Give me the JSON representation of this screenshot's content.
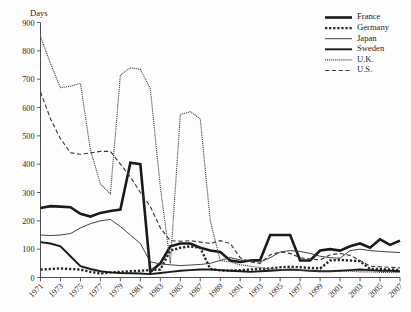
{
  "chart_data": {
    "type": "line",
    "title": "",
    "xlabel": "",
    "ylabel": "Days",
    "ylim": [
      0,
      900
    ],
    "ytick_labels": [
      "0",
      "100",
      "200",
      "300",
      "400",
      "500",
      "600",
      "700",
      "800",
      "900"
    ],
    "ytick_values": [
      0,
      100,
      200,
      300,
      400,
      500,
      600,
      700,
      800,
      900
    ],
    "grid": false,
    "legend_position": "top-right",
    "x": [
      1971,
      1972,
      1973,
      1974,
      1975,
      1976,
      1977,
      1978,
      1979,
      1980,
      1981,
      1982,
      1983,
      1984,
      1985,
      1986,
      1987,
      1988,
      1989,
      1990,
      1991,
      1992,
      1993,
      1994,
      1995,
      1996,
      1997,
      1998,
      1999,
      2000,
      2001,
      2002,
      2003,
      2004,
      2005,
      2006,
      2007
    ],
    "xtick_labels": [
      "1971",
      "1973",
      "1975",
      "1977",
      "1979",
      "1981",
      "1983",
      "1985",
      "1987",
      "1989",
      "1991",
      "1993",
      "1995",
      "1997",
      "1999",
      "2001",
      "2003",
      "2005",
      "2007"
    ],
    "xtick_values": [
      1971,
      1973,
      1975,
      1977,
      1979,
      1981,
      1983,
      1985,
      1987,
      1989,
      1991,
      1993,
      1995,
      1997,
      1999,
      2001,
      2003,
      2005,
      2007
    ],
    "series": [
      {
        "name": "France",
        "style": "solid",
        "width": 2.6,
        "color": "#1a1a1a",
        "values": [
          245,
          252,
          250,
          248,
          225,
          215,
          228,
          235,
          240,
          405,
          400,
          20,
          50,
          110,
          120,
          120,
          105,
          95,
          90,
          60,
          55,
          60,
          62,
          150,
          150,
          150,
          60,
          60,
          95,
          100,
          95,
          110,
          120,
          105,
          135,
          115,
          130
        ]
      },
      {
        "name": "Germany",
        "style": "dotted",
        "width": 2.4,
        "color": "#2a2a2a",
        "values": [
          28,
          30,
          32,
          30,
          28,
          20,
          14,
          18,
          20,
          22,
          24,
          26,
          28,
          95,
          105,
          110,
          105,
          30,
          25,
          24,
          26,
          28,
          30,
          32,
          36,
          38,
          36,
          34,
          32,
          60,
          62,
          60,
          58,
          30,
          30,
          28,
          26
        ]
      },
      {
        "name": "Japan",
        "style": "solid",
        "width": 0.95,
        "color": "#3a3a3a",
        "values": [
          150,
          148,
          150,
          155,
          175,
          190,
          200,
          205,
          180,
          150,
          120,
          55,
          48,
          45,
          42,
          44,
          46,
          50,
          60,
          70,
          62,
          58,
          55,
          70,
          90,
          95,
          92,
          85,
          75,
          70,
          68,
          95,
          100,
          95,
          92,
          90,
          88
        ]
      },
      {
        "name": "Sweden",
        "style": "solid",
        "width": 1.9,
        "color": "#1a1a1a",
        "values": [
          125,
          120,
          110,
          75,
          40,
          30,
          22,
          18,
          16,
          15,
          14,
          12,
          16,
          20,
          24,
          26,
          28,
          28,
          26,
          24,
          22,
          20,
          22,
          24,
          26,
          28,
          26,
          24,
          22,
          22,
          24,
          26,
          28,
          26,
          24,
          24,
          22
        ]
      },
      {
        "name": "U.K.",
        "style": "dotted",
        "width": 1.15,
        "color": "#4a4a4a",
        "values": [
          850,
          755,
          670,
          675,
          685,
          450,
          330,
          295,
          715,
          740,
          735,
          665,
          320,
          50,
          575,
          585,
          560,
          200,
          60,
          55,
          45,
          40,
          35,
          30,
          28,
          26,
          25,
          24,
          22,
          22,
          22,
          22,
          20,
          20,
          18,
          18,
          18
        ]
      },
      {
        "name": "U.S.",
        "style": "dashed",
        "width": 1.15,
        "color": "#3a3a3a",
        "values": [
          655,
          560,
          490,
          440,
          435,
          440,
          445,
          445,
          400,
          355,
          300,
          250,
          175,
          130,
          128,
          130,
          125,
          120,
          130,
          120,
          70,
          55,
          50,
          80,
          90,
          85,
          70,
          65,
          62,
          80,
          85,
          78,
          60,
          40,
          38,
          36,
          34
        ]
      }
    ]
  },
  "legend": {
    "items": [
      {
        "label": "France"
      },
      {
        "label": "Germany"
      },
      {
        "label": "Japan"
      },
      {
        "label": "Sweden"
      },
      {
        "label": "U.K."
      },
      {
        "label": "U.S."
      }
    ]
  }
}
